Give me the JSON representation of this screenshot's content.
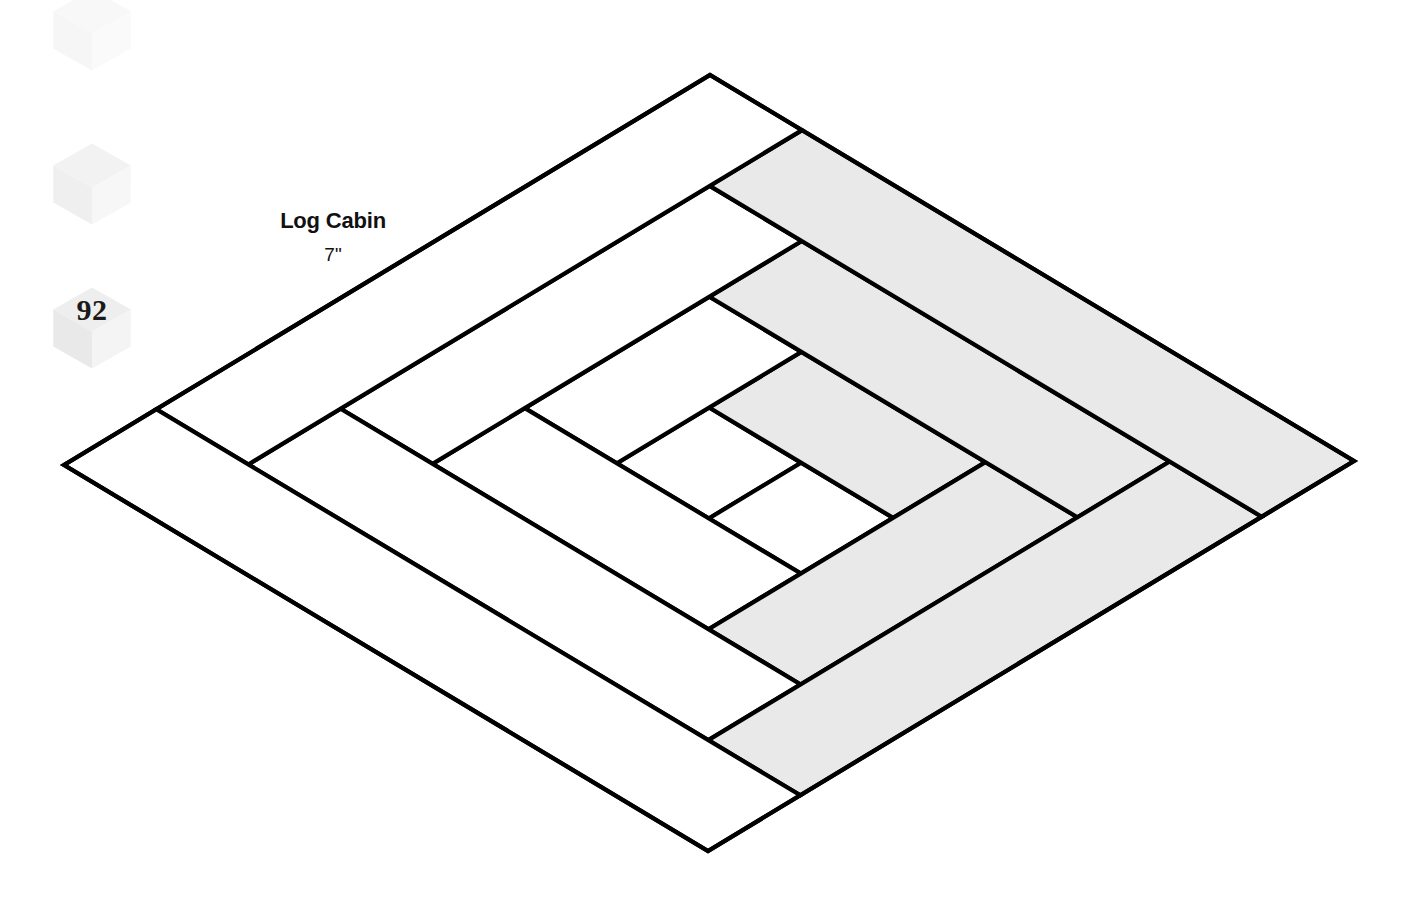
{
  "page": {
    "background": "#ffffff",
    "width": 1426,
    "height": 900
  },
  "block": {
    "name": "Log Cabin",
    "size": "7\"",
    "label_x": 333,
    "title_y": 208,
    "size_y": 244,
    "outline_color": "#000000",
    "stroke_width": 4.2,
    "light_fabric_color": "#ffffff",
    "dark_fabric_color": "#e9e9e9",
    "diamond": {
      "top": [
        710,
        75
      ],
      "right": [
        1362,
        467
      ],
      "bottom": [
        708,
        851
      ],
      "left": [
        64,
        465
      ]
    },
    "grid_units": 7,
    "pieces": [
      {
        "name": "center-square",
        "fabric": "light",
        "u0": 3,
        "v0": 3,
        "u1": 4,
        "v1": 4
      },
      {
        "name": "log-1-right-of-center",
        "fabric": "light",
        "u0": 4,
        "v0": 3,
        "u1": 5,
        "v1": 4
      },
      {
        "name": "log-2-top-right",
        "fabric": "dark",
        "u0": 3,
        "v0": 4,
        "u1": 5,
        "v1": 5
      },
      {
        "name": "log-3-left",
        "fabric": "light",
        "u0": 2,
        "v0": 3,
        "u1": 3,
        "v1": 5
      },
      {
        "name": "log-4-bottom",
        "fabric": "light",
        "u0": 2,
        "v0": 2,
        "u1": 5,
        "v1": 3
      },
      {
        "name": "log-5-right",
        "fabric": "dark",
        "u0": 5,
        "v0": 2,
        "u1": 6,
        "v1": 5
      },
      {
        "name": "log-6-top",
        "fabric": "dark",
        "u0": 2,
        "v0": 5,
        "u1": 6,
        "v1": 6
      },
      {
        "name": "log-7-left-outer",
        "fabric": "light",
        "u0": 1,
        "v0": 2,
        "u1": 2,
        "v1": 6
      },
      {
        "name": "log-8-bottom-outer",
        "fabric": "light",
        "u0": 1,
        "v0": 1,
        "u1": 6,
        "v1": 2
      },
      {
        "name": "log-9-right-outer",
        "fabric": "dark",
        "u0": 6,
        "v0": 1,
        "u1": 7,
        "v1": 6
      },
      {
        "name": "log-10-top-outer",
        "fabric": "dark",
        "u0": 1,
        "v0": 6,
        "u1": 7,
        "v1": 7
      },
      {
        "name": "log-11-left-border",
        "fabric": "light",
        "u0": 0,
        "v0": 1,
        "u1": 1,
        "v1": 7
      },
      {
        "name": "log-12-bottom-border",
        "fabric": "light",
        "u0": 0,
        "v0": 0,
        "u1": 7,
        "v1": 1
      }
    ]
  },
  "cube_badges": [
    {
      "name": "cube-badge-top",
      "number": "",
      "x": 48,
      "y": -14,
      "size": 88,
      "opacity": 0.055
    },
    {
      "name": "cube-badge-middle",
      "number": "",
      "x": 48,
      "y": 140,
      "size": 88,
      "opacity": 0.1
    },
    {
      "name": "cube-badge-number",
      "number": "92",
      "x": 48,
      "y": 284,
      "size": 88,
      "opacity": 0.14
    }
  ],
  "cube_colors": {
    "top_face": "#8a8a8a",
    "left_face": "#6d6d6d",
    "right_face": "#b4b4b4"
  }
}
